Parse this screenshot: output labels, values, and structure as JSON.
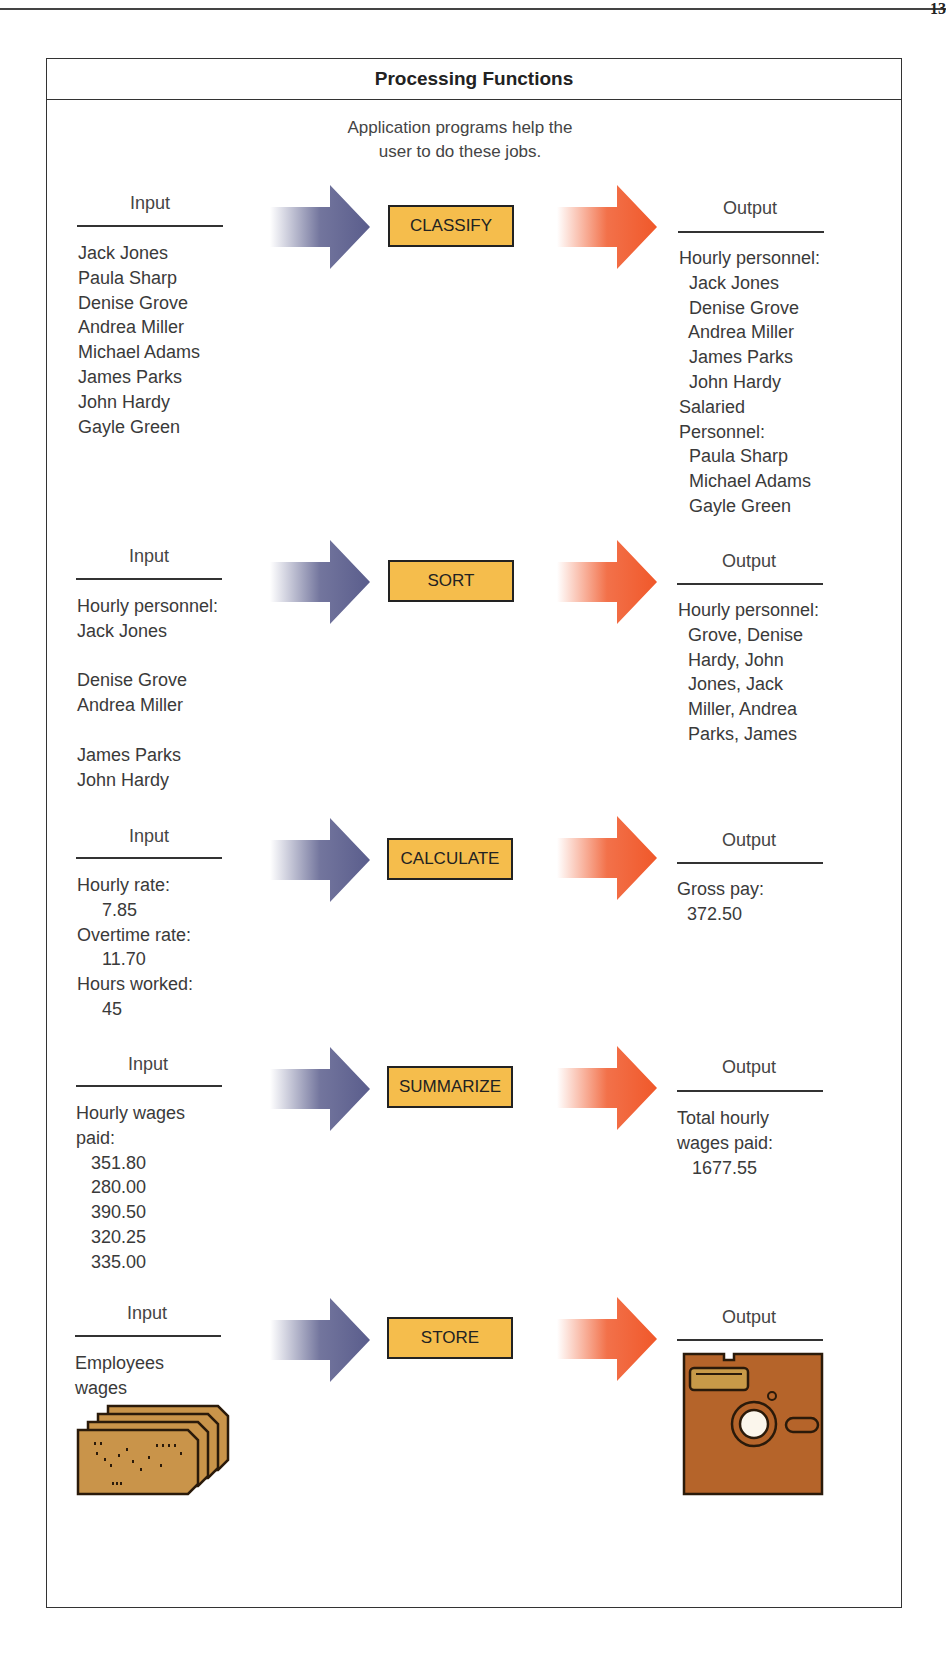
{
  "page": {
    "corner_mark": "13"
  },
  "figure": {
    "title": "Processing Functions",
    "subtitle_line1": "Application programs help the",
    "subtitle_line2": "user to do these jobs.",
    "colors": {
      "box": "#f5bd4c",
      "input_arrow": "#5a5d8c",
      "output_arrow": "#f0582a",
      "card": "#c9944a",
      "disk": "#b5642a"
    }
  },
  "rows": [
    {
      "function": "CLASSIFY",
      "input": {
        "header": "Input",
        "text": "Jack Jones\nPaula Sharp\nDenise Grove\nAndrea Miller\nMichael Adams\nJames Parks\nJohn Hardy\nGayle Green"
      },
      "output": {
        "header": "Output",
        "text": "Hourly personnel:\n  Jack Jones\n  Denise Grove\n  Andrea Miller\n  James Parks\n  John Hardy\nSalaried\nPersonnel:\n  Paula Sharp\n  Michael Adams\n  Gayle Green"
      }
    },
    {
      "function": "SORT",
      "input": {
        "header": "Input",
        "text": "Hourly personnel:\nJack Jones\n\nDenise Grove\nAndrea Miller\n\nJames Parks\nJohn Hardy"
      },
      "output": {
        "header": "Output",
        "text": "Hourly personnel:\n  Grove, Denise\n  Hardy, John\n  Jones, Jack\n  Miller, Andrea\n  Parks, James"
      }
    },
    {
      "function": "CALCULATE",
      "input": {
        "header": "Input",
        "text": "Hourly rate:\n     7.85\nOvertime rate:\n     11.70\nHours worked:\n     45"
      },
      "output": {
        "header": "Output",
        "text": "Gross pay:\n  372.50"
      }
    },
    {
      "function": "SUMMARIZE",
      "input": {
        "header": "Input",
        "text": "Hourly wages\npaid:\n   351.80\n   280.00\n   390.50\n   320.25\n   335.00"
      },
      "output": {
        "header": "Output",
        "text": "Total hourly\nwages paid:\n   1677.55"
      }
    },
    {
      "function": "STORE",
      "input": {
        "header": "Input",
        "text": "Employees\nwages",
        "image": "punched-cards-icon"
      },
      "output": {
        "header": "Output",
        "image": "floppy-disk-icon"
      }
    }
  ]
}
